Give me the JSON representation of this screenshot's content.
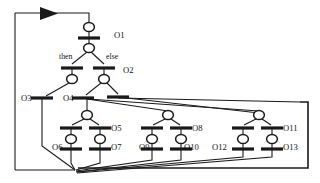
{
  "figure": {
    "kind": "petri-net",
    "title": "",
    "background": "#ffffff",
    "ink": "#1a1a1a",
    "width": 320,
    "height": 183
  },
  "labels": {
    "o1": "O1",
    "o2": "O2",
    "o3": "O3",
    "o4": "O4",
    "o5": "O5",
    "o6": "O6",
    "o7": "O7",
    "o8": "O8",
    "o9": "O9",
    "o10": "O10",
    "o11": "O11",
    "o12": "O12",
    "o13": "O13",
    "then": "then",
    "else": "else"
  },
  "label_positions": {
    "o1": {
      "x": 114,
      "y": 38
    },
    "o2": {
      "x": 123,
      "y": 73
    },
    "o3": {
      "x": 21,
      "y": 101
    },
    "o4": {
      "x": 63,
      "y": 101
    },
    "o5": {
      "x": 111,
      "y": 131
    },
    "o6": {
      "x": 52,
      "y": 150
    },
    "o7": {
      "x": 111,
      "y": 150
    },
    "o8": {
      "x": 192,
      "y": 131
    },
    "o9": {
      "x": 139,
      "y": 150
    },
    "o10": {
      "x": 184,
      "y": 150
    },
    "o11": {
      "x": 283,
      "y": 131
    },
    "o12": {
      "x": 212,
      "y": 150
    },
    "o13": {
      "x": 283,
      "y": 150
    },
    "then": {
      "x": 59,
      "y": 59
    },
    "else": {
      "x": 106,
      "y": 59
    }
  },
  "places": [
    {
      "id": "p_top",
      "name": "place-top",
      "cx": 89,
      "cy": 27,
      "rx": 5.4,
      "ry": 4.6
    },
    {
      "id": "p_o1",
      "name": "place-below-o1",
      "cx": 89,
      "cy": 48,
      "rx": 5.4,
      "ry": 4.6
    },
    {
      "id": "p_then",
      "name": "place-then-branch",
      "cx": 72,
      "cy": 79,
      "rx": 5.4,
      "ry": 4.6
    },
    {
      "id": "p_else",
      "name": "place-else-branch",
      "cx": 104,
      "cy": 79,
      "rx": 5.4,
      "ry": 4.6
    },
    {
      "id": "p_l1",
      "name": "place-left-fork",
      "cx": 87,
      "cy": 115,
      "rx": 5.4,
      "ry": 4.6
    },
    {
      "id": "p_l2",
      "name": "place-o6-input",
      "cx": 71,
      "cy": 139,
      "rx": 5.4,
      "ry": 4.6
    },
    {
      "id": "p_l3",
      "name": "place-o7-input",
      "cx": 100,
      "cy": 139,
      "rx": 5.4,
      "ry": 4.6
    },
    {
      "id": "p_m1",
      "name": "place-mid-fork",
      "cx": 168,
      "cy": 115,
      "rx": 5.4,
      "ry": 4.6
    },
    {
      "id": "p_m2",
      "name": "place-o9-input",
      "cx": 152,
      "cy": 139,
      "rx": 5.4,
      "ry": 4.6
    },
    {
      "id": "p_m3",
      "name": "place-o10-input",
      "cx": 181,
      "cy": 139,
      "rx": 5.4,
      "ry": 4.6
    },
    {
      "id": "p_r1",
      "name": "place-right-fork",
      "cx": 259,
      "cy": 115,
      "rx": 5.4,
      "ry": 4.6
    },
    {
      "id": "p_r2",
      "name": "place-o12-input",
      "cx": 243,
      "cy": 139,
      "rx": 5.4,
      "ry": 4.6
    },
    {
      "id": "p_r3",
      "name": "place-o13-input",
      "cx": 272,
      "cy": 139,
      "rx": 5.4,
      "ry": 4.6
    }
  ],
  "transitions": [
    {
      "id": "t_o1",
      "name": "transition-o1",
      "cx": 89,
      "cy": 38,
      "half": 11
    },
    {
      "id": "t_then",
      "name": "transition-then",
      "cx": 72,
      "cy": 68,
      "half": 11
    },
    {
      "id": "t_else",
      "name": "transition-else",
      "cx": 104,
      "cy": 68,
      "half": 11
    },
    {
      "id": "t_o3",
      "name": "transition-o3",
      "cx": 42,
      "cy": 98,
      "half": 11
    },
    {
      "id": "t_o4",
      "name": "transition-o4",
      "cx": 83,
      "cy": 98,
      "half": 11
    },
    {
      "id": "t_join",
      "name": "transition-join",
      "cx": 118,
      "cy": 97,
      "half": 11
    },
    {
      "id": "t_o5a",
      "name": "transition-o5-left",
      "cx": 71,
      "cy": 128,
      "half": 11
    },
    {
      "id": "t_o5b",
      "name": "transition-o5-right",
      "cx": 100,
      "cy": 128,
      "half": 11
    },
    {
      "id": "t_o6",
      "name": "transition-o6",
      "cx": 71,
      "cy": 149,
      "half": 11
    },
    {
      "id": "t_o7",
      "name": "transition-o7",
      "cx": 100,
      "cy": 149,
      "half": 11
    },
    {
      "id": "t_o8a",
      "name": "transition-o8-left",
      "cx": 152,
      "cy": 128,
      "half": 11
    },
    {
      "id": "t_o8b",
      "name": "transition-o8-right",
      "cx": 181,
      "cy": 128,
      "half": 11
    },
    {
      "id": "t_o9",
      "name": "transition-o9",
      "cx": 152,
      "cy": 149,
      "half": 11
    },
    {
      "id": "t_o10",
      "name": "transition-o10",
      "cx": 181,
      "cy": 149,
      "half": 11
    },
    {
      "id": "t_o11a",
      "name": "transition-o11-left",
      "cx": 243,
      "cy": 128,
      "half": 11
    },
    {
      "id": "t_o11b",
      "name": "transition-o11-right",
      "cx": 272,
      "cy": 128,
      "half": 11
    },
    {
      "id": "t_o12",
      "name": "transition-o12",
      "cx": 243,
      "cy": 149,
      "half": 11
    },
    {
      "id": "t_o13",
      "name": "transition-o13",
      "cx": 272,
      "cy": 149,
      "half": 11
    }
  ],
  "edges": [
    {
      "name": "edge-feedback-left-vertical",
      "d": "M 15 13 L 15 170"
    },
    {
      "name": "edge-feedback-top",
      "d": "M 15 13 L 89 13 L 89 22"
    },
    {
      "name": "edge-feedback-bottom",
      "d": "M 15 170 L 75 170"
    },
    {
      "name": "edge-top-place-to-t1",
      "d": "M 89 32 L 89 38"
    },
    {
      "name": "edge-t1-to-place",
      "d": "M 89 38 L 89 43"
    },
    {
      "name": "edge-place-to-then",
      "d": "M 87 52 L 72 64"
    },
    {
      "name": "edge-place-to-else",
      "d": "M 91 52 L 104 64"
    },
    {
      "name": "edge-then-to-place",
      "d": "M 72 68 L 72 75"
    },
    {
      "name": "edge-else-to-place",
      "d": "M 104 68 L 104 75"
    },
    {
      "name": "edge-thenplace-to-o3",
      "d": "M 69 83 L 46 96"
    },
    {
      "name": "edge-elseplace-to-o4",
      "d": "M 101 83 L 86 95"
    },
    {
      "name": "edge-elseplace-to-join",
      "d": "M 107 83 L 118 94"
    },
    {
      "name": "edge-o3-down",
      "d": "M 42 99 L 42 146 L 75 170"
    },
    {
      "name": "edge-o4-down-to-place",
      "d": "M 87 99 L 87 110"
    },
    {
      "name": "edge-o4-fan-to-mid",
      "d": "M 87 99 L 168 111"
    },
    {
      "name": "edge-o4-fan-to-right",
      "d": "M 88 99 L 259 111"
    },
    {
      "name": "edge-join-fan-mid",
      "d": "M 118 97 L 259 113"
    },
    {
      "name": "edge-join-fan-right",
      "d": "M 118 98 L 300 102"
    },
    {
      "name": "edge-lplace-to-t5a",
      "d": "M 84 119 L 72 125"
    },
    {
      "name": "edge-lplace-to-t5b",
      "d": "M 90 119 L 99 125"
    },
    {
      "name": "edge-t5a-to-place",
      "d": "M 71 128 L 71 135"
    },
    {
      "name": "edge-t5b-to-place",
      "d": "M 100 128 L 100 135"
    },
    {
      "name": "edge-place-to-o6",
      "d": "M 71 143 L 71 149"
    },
    {
      "name": "edge-place-to-o7",
      "d": "M 100 143 L 100 149"
    },
    {
      "name": "edge-o6-out",
      "d": "M 71 150 L 71 163 L 75 170"
    },
    {
      "name": "edge-o7-out",
      "d": "M 100 150 L 100 163 L 76 170"
    },
    {
      "name": "edge-mplace-to-t8a",
      "d": "M 165 119 L 153 125"
    },
    {
      "name": "edge-mplace-to-t8b",
      "d": "M 171 119 L 180 125"
    },
    {
      "name": "edge-t8a-to-place",
      "d": "M 152 128 L 152 135"
    },
    {
      "name": "edge-t8b-to-place",
      "d": "M 181 128 L 181 135"
    },
    {
      "name": "edge-place-to-o9",
      "d": "M 152 143 L 152 149"
    },
    {
      "name": "edge-place-to-o10",
      "d": "M 181 143 L 181 149"
    },
    {
      "name": "edge-o9-out",
      "d": "M 152 150 L 152 160 L 76 171"
    },
    {
      "name": "edge-o10-out",
      "d": "M 181 150 L 181 160 L 76 172"
    },
    {
      "name": "edge-rplace-to-t11a",
      "d": "M 256 119 L 244 125"
    },
    {
      "name": "edge-rplace-to-t11b",
      "d": "M 262 119 L 271 125"
    },
    {
      "name": "edge-t11a-to-place",
      "d": "M 243 128 L 243 135"
    },
    {
      "name": "edge-t11b-to-place",
      "d": "M 272 128 L 272 135"
    },
    {
      "name": "edge-place-to-o12",
      "d": "M 243 143 L 243 149"
    },
    {
      "name": "edge-place-to-o13",
      "d": "M 272 143 L 272 149"
    },
    {
      "name": "edge-o12-out",
      "d": "M 243 150 L 243 157 L 77 172"
    },
    {
      "name": "edge-o13-out",
      "d": "M 272 150 L 272 157 L 77 173"
    }
  ],
  "frame": {
    "name": "outer-right-frame",
    "d": "M 300 102 L 308 102 L 308 168 L 78 168"
  },
  "arrow": {
    "name": "flow-arrowhead",
    "points": "40,7 58,13.5 40,20"
  }
}
